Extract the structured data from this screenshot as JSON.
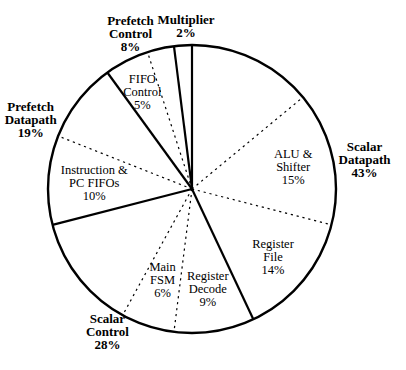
{
  "figure": {
    "background_color": "#ffffff",
    "stroke_color": "#000000"
  },
  "chart_data": {
    "type": "pie",
    "title": "",
    "units": "percent",
    "total_pct": 100,
    "direction": "clockwise",
    "start_angle_deg": 0,
    "line_styles": {
      "group_boundary": "solid",
      "segment_boundary": "dashed"
    },
    "groups": [
      {
        "id": "scalar-datapath",
        "name": "Scalar Datapath",
        "pct": 43,
        "label_lines": [
          "Scalar",
          "Datapath",
          "43%"
        ],
        "segments": [
          {
            "id": "scalar-datapath-other",
            "name": "",
            "pct": 14,
            "label_lines": []
          },
          {
            "id": "alu-shifter",
            "name": "ALU & Shifter",
            "pct": 15,
            "label_lines": [
              "ALU &",
              "Shifter",
              "15%"
            ]
          },
          {
            "id": "register-file",
            "name": "Register File",
            "pct": 14,
            "label_lines": [
              "Register",
              "File",
              "14%"
            ]
          }
        ]
      },
      {
        "id": "scalar-control",
        "name": "Scalar Control",
        "pct": 28,
        "label_lines": [
          "Scalar",
          "Control",
          "28%"
        ],
        "segments": [
          {
            "id": "register-decode",
            "name": "Register Decode",
            "pct": 9,
            "label_lines": [
              "Register",
              "Decode",
              "9%"
            ]
          },
          {
            "id": "main-fsm",
            "name": "Main FSM",
            "pct": 6,
            "label_lines": [
              "Main",
              "FSM",
              "6%"
            ]
          },
          {
            "id": "scalar-control-other",
            "name": "",
            "pct": 13,
            "label_lines": []
          }
        ]
      },
      {
        "id": "prefetch-datapath",
        "name": "Prefetch Datapath",
        "pct": 19,
        "label_lines": [
          "Prefetch",
          "Datapath",
          "19%"
        ],
        "segments": [
          {
            "id": "instruction-pc-fifos",
            "name": "Instruction & PC FIFOs",
            "pct": 10,
            "label_lines": [
              "Instruction &",
              "PC FIFOs",
              "10%"
            ]
          },
          {
            "id": "prefetch-datapath-other",
            "name": "",
            "pct": 9,
            "label_lines": []
          }
        ]
      },
      {
        "id": "prefetch-control",
        "name": "Prefetch Control",
        "pct": 8,
        "label_lines": [
          "Prefetch",
          "Control",
          "8%"
        ],
        "segments": [
          {
            "id": "fifo-control",
            "name": "FIFO Control",
            "pct": 5,
            "label_lines": [
              "FIFO",
              "Control",
              "5%"
            ]
          },
          {
            "id": "prefetch-control-other",
            "name": "",
            "pct": 3,
            "label_lines": []
          }
        ]
      },
      {
        "id": "multiplier",
        "name": "Multiplier",
        "pct": 2,
        "label_lines": [
          "Multiplier",
          "2%"
        ],
        "segments": []
      }
    ]
  }
}
